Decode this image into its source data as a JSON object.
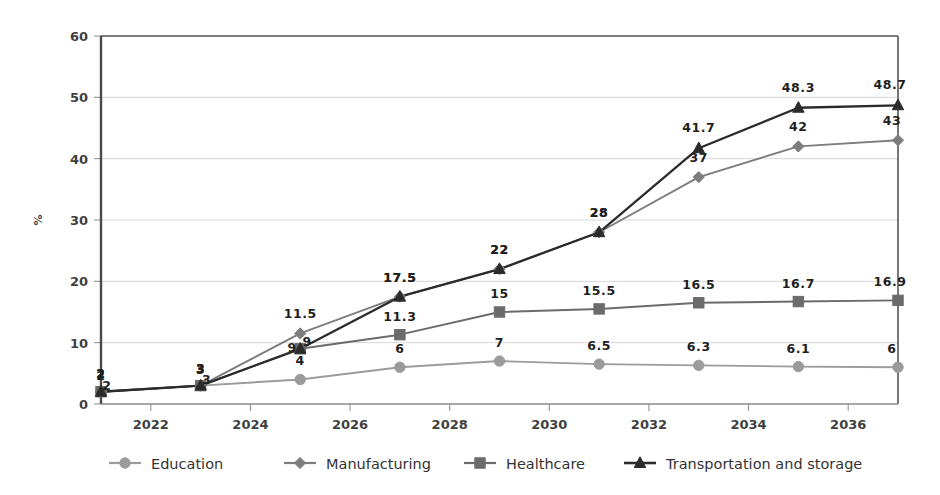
{
  "chart_data": {
    "type": "line",
    "title": "",
    "xlabel": "",
    "ylabel": "%",
    "ylim": [
      0,
      60
    ],
    "ytick_step": 10,
    "yticks": [
      "0",
      "10",
      "20",
      "30",
      "40",
      "50",
      "60"
    ],
    "xlim": [
      2021,
      2037
    ],
    "xticks": [
      "2022",
      "2024",
      "2026",
      "2028",
      "2030",
      "2032",
      "2034",
      "2036"
    ],
    "x": [
      2021,
      2023,
      2025,
      2027,
      2029,
      2031,
      2033,
      2035,
      2037
    ],
    "grid": "horizontal",
    "legend_position": "bottom",
    "series": [
      {
        "name": "Education",
        "marker": "circle",
        "color": "#9b9b9b",
        "values": [
          2,
          3,
          4,
          6,
          7,
          6.5,
          6.3,
          6.1,
          6
        ],
        "labels": [
          "2",
          "3",
          "4",
          "6",
          "7",
          "6.5",
          "6.3",
          "6.1",
          "6"
        ]
      },
      {
        "name": "Manufacturing",
        "marker": "diamond",
        "color": "#7d7d7d",
        "values": [
          2,
          3,
          11.5,
          17.5,
          22,
          28,
          37,
          42,
          43
        ],
        "labels": [
          "2",
          "3",
          "11.5",
          "17.5",
          "22",
          "28",
          "37",
          "42",
          "43"
        ]
      },
      {
        "name": "Healthcare",
        "marker": "square",
        "color": "#6b6b6b",
        "values": [
          2,
          3,
          9,
          11.3,
          15,
          15.5,
          16.5,
          16.7,
          16.9
        ],
        "labels": [
          "2",
          "3",
          "9",
          "11.3",
          "15",
          "15.5",
          "16.5",
          "16.7",
          "16.9"
        ]
      },
      {
        "name": "Transportation and storage",
        "marker": "triangle",
        "color": "#2b2b2b",
        "values": [
          2,
          3,
          9,
          17.5,
          22,
          28,
          41.7,
          48.3,
          48.7
        ],
        "labels": [
          "2",
          "3",
          "9",
          "17.5",
          "22",
          "28",
          "41.7",
          "48.3",
          "48.7"
        ]
      }
    ]
  },
  "legend": {
    "items": [
      {
        "label": "Education",
        "marker": "circle",
        "color": "#9b9b9b"
      },
      {
        "label": "Manufacturing",
        "marker": "diamond",
        "color": "#7d7d7d"
      },
      {
        "label": "Healthcare",
        "marker": "square",
        "color": "#6b6b6b"
      },
      {
        "label": "Transportation and storage",
        "marker": "triangle",
        "color": "#2b2b2b"
      }
    ]
  },
  "axis": {
    "y_title": "%"
  },
  "style": {
    "plot_border": "#555555",
    "gridline": "#d8d8d8",
    "background": "#ffffff"
  }
}
